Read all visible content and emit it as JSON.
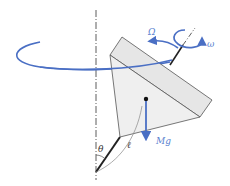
{
  "diagram": {
    "labels": {
      "precession": "Ω",
      "spin": "ω",
      "weight": "Mg",
      "angle": "θ",
      "length": "ℓ"
    },
    "colors": {
      "arrow": "#4a6fc4",
      "body_fill": "#ececec",
      "body_stroke": "#555555",
      "axis": "#333333",
      "label_blue": "#5a7fcf",
      "label_dark": "#333333"
    }
  }
}
